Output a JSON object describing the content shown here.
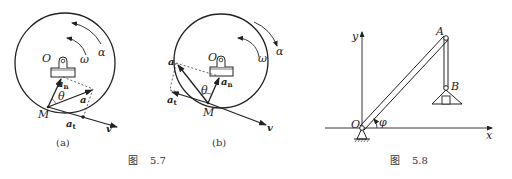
{
  "figure_5_7": {
    "caption_prefix": "图",
    "caption_number": "5.7",
    "panel_a": {
      "label": "(a)",
      "center": "O",
      "omega": "ω",
      "alpha": "α",
      "point": "M",
      "theta": "θ",
      "accel": "a",
      "normal_accel": "a",
      "normal_sub": "n",
      "tangential_accel": "a",
      "tangential_sub": "t",
      "velocity": "v"
    },
    "panel_b": {
      "label": "(b)",
      "center": "O",
      "omega": "ω",
      "alpha": "α",
      "point": "M",
      "theta": "θ",
      "accel": "a",
      "normal_accel": "a",
      "normal_sub": "n",
      "tangential_accel": "a",
      "tangential_sub": "t",
      "velocity": "v"
    }
  },
  "figure_5_8": {
    "caption_prefix": "图",
    "caption_number": "5.8",
    "axis_x": "x",
    "axis_y": "y",
    "origin": "O",
    "point_a": "A",
    "point_b": "B",
    "angle": "φ"
  }
}
